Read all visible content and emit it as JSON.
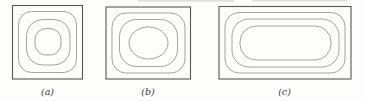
{
  "figure": {
    "background": "#fdfdfb",
    "colors": {
      "boundary_line": "#565656",
      "contour_line": "#929292",
      "label_text": "#3c3c3c",
      "scan_artifact": "#bfbfbf"
    },
    "stroke_widths": {
      "boundary": 1.1,
      "contour": 0.85
    },
    "label_baseline_y": 95,
    "panels": [
      {
        "id": "a",
        "label": "(a)",
        "description": "square boundary with three nested closed contours",
        "box": {
          "x": 12.5,
          "y": 5.5,
          "w": 70,
          "h": 73.5
        },
        "contours": [
          {
            "shape": "rect",
            "x": 18.5,
            "y": 11.5,
            "w": 58,
            "h": 61,
            "r": 13
          },
          {
            "shape": "rect",
            "x": 26.5,
            "y": 19.5,
            "w": 43.5,
            "h": 45.5,
            "r": 16
          },
          {
            "shape": "rect",
            "x": 35,
            "y": 28.5,
            "w": 26,
            "h": 26.5,
            "r": 11
          }
        ],
        "label_cx": 47.5
      },
      {
        "id": "b",
        "label": "(b)",
        "description": "slightly oblong rectangular boundary with three nested closed contours, innermost elliptical",
        "box": {
          "x": 106,
          "y": 7,
          "w": 84.5,
          "h": 72
        },
        "contours": [
          {
            "shape": "rect",
            "x": 112,
            "y": 13,
            "w": 73,
            "h": 60,
            "r": 14
          },
          {
            "shape": "rect",
            "x": 119.5,
            "y": 19.5,
            "w": 58,
            "h": 47,
            "r": 17
          },
          {
            "shape": "ellipse",
            "cx": 148.5,
            "cy": 43,
            "rx": 19.5,
            "ry": 16
          }
        ],
        "label_cx": 148
      },
      {
        "id": "c",
        "label": "(c)",
        "description": "wide rectangular boundary with three nested elongated rounded contours",
        "box": {
          "x": 219,
          "y": 6.5,
          "w": 132,
          "h": 72.5
        },
        "contours": [
          {
            "shape": "rect",
            "x": 225,
            "y": 12.5,
            "w": 120,
            "h": 60.5,
            "r": 14
          },
          {
            "shape": "rect",
            "x": 232,
            "y": 19,
            "w": 107,
            "h": 48,
            "r": 17
          },
          {
            "shape": "rect",
            "x": 240,
            "y": 26,
            "w": 91,
            "h": 34,
            "r": 16
          }
        ],
        "label_cx": 284.5
      }
    ],
    "scan_artifacts": [
      {
        "x": 138,
        "y": 0,
        "w": 96,
        "h": 1.6
      },
      {
        "x": 252,
        "y": 0,
        "w": 95,
        "h": 1.4
      }
    ]
  }
}
